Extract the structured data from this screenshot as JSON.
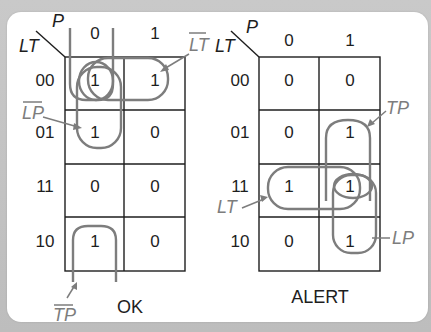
{
  "kmaps": [
    {
      "id": "ok",
      "title": "OK",
      "row_var": "LT",
      "col_var": "P",
      "col_headers": [
        "0",
        "1"
      ],
      "row_headers": [
        "00",
        "01",
        "11",
        "10"
      ],
      "cells": [
        [
          "1",
          "1"
        ],
        [
          "1",
          "0"
        ],
        [
          "0",
          "0"
        ],
        [
          "1",
          "0"
        ]
      ],
      "groups": [
        {
          "label": "LT",
          "negated": true,
          "covers": "row 00, cols 0-1"
        },
        {
          "label": "LP",
          "negated": true,
          "covers": "col 0, rows 00-01"
        },
        {
          "label": "TP",
          "negated": true,
          "covers": "col 0, rows 00 & 10 (wrap-around)"
        }
      ]
    },
    {
      "id": "alert",
      "title": "ALERT",
      "row_var": "LT",
      "col_var": "P",
      "col_headers": [
        "0",
        "1"
      ],
      "row_headers": [
        "00",
        "01",
        "11",
        "10"
      ],
      "cells": [
        [
          "0",
          "0"
        ],
        [
          "0",
          "1"
        ],
        [
          "1",
          "1"
        ],
        [
          "0",
          "1"
        ]
      ],
      "groups": [
        {
          "label": "TP",
          "negated": false,
          "covers": "col 1, rows 01-11"
        },
        {
          "label": "LT",
          "negated": false,
          "covers": "row 11, cols 0-1"
        },
        {
          "label": "LP",
          "negated": false,
          "covers": "col 1, rows 11-10"
        }
      ]
    }
  ],
  "colors": {
    "grid": "#1e1e1e",
    "loops": "#7d7d7d",
    "panel": "#ffffff",
    "background": "#c4c4c4"
  }
}
